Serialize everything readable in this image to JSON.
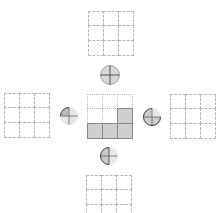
{
  "figure": {
    "center_grid": {
      "rows": 3,
      "cols": 3,
      "filled_cells": [
        [
          1,
          2
        ],
        [
          2,
          0
        ],
        [
          2,
          1
        ],
        [
          2,
          2
        ]
      ],
      "fill_color": "#cfcfcf"
    },
    "outer_grids": [
      {
        "position": "top",
        "rows": 3,
        "cols": 3,
        "filled_cells": []
      },
      {
        "position": "left",
        "rows": 3,
        "cols": 3,
        "filled_cells": []
      },
      {
        "position": "right",
        "rows": 3,
        "cols": 3,
        "filled_cells": []
      },
      {
        "position": "bottom",
        "rows": 3,
        "cols": 3,
        "filled_cells": []
      }
    ],
    "dials": [
      {
        "position": "top",
        "shaded_fraction": "full",
        "icon": "rotation-dial-full-icon"
      },
      {
        "position": "left",
        "shaded_fraction": "quarter-top-left",
        "icon": "rotation-dial-quarter-icon"
      },
      {
        "position": "right",
        "shaded_fraction": "three-quarter",
        "icon": "rotation-dial-three-quarter-icon"
      },
      {
        "position": "bottom",
        "shaded_fraction": "half-left",
        "icon": "rotation-dial-half-icon"
      }
    ],
    "colors": {
      "grid_line": "#b8b8b8",
      "fill": "#cfcfcf",
      "dial_fill": "#e0e0e0",
      "dial_line": "#555555"
    }
  }
}
